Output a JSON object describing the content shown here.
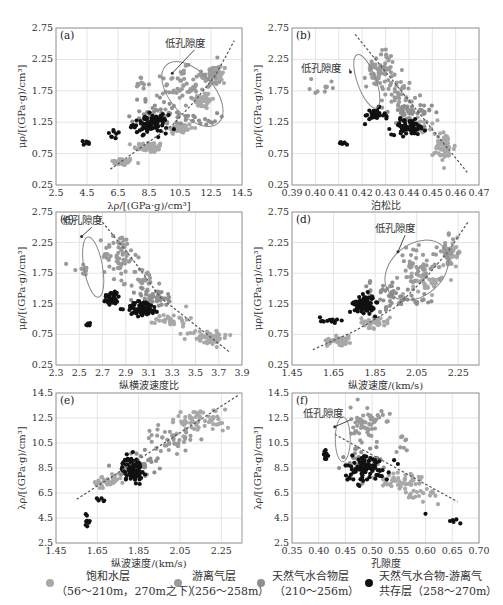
{
  "colors": {
    "saturated": "#a8a8a8",
    "free_gas": "#9a9a9a",
    "hydrate": "#8f8f8f",
    "coexist": "#111111",
    "grid": "#e4e4e4",
    "frame": "#999999",
    "trend": "#555555",
    "ellipse": "#888888"
  },
  "annotation_text": "低孔隙度",
  "chart_data": [
    {
      "id": "a",
      "type": "scatter",
      "label": "(a)",
      "box": [
        56,
        28,
        242,
        185
      ],
      "xlabel": "λρ/[(GPa·g)/cm³]",
      "ylabel": "μρ/[(GPa·g)/cm³]",
      "xlim": [
        2.5,
        14.5
      ],
      "ylim": [
        0.25,
        2.75
      ],
      "xticks": [
        "2.5",
        "4.5",
        "6.5",
        "8.5",
        "10.5",
        "12.5",
        "14.5"
      ],
      "yticks": [
        "0.25",
        "0.75",
        "1.25",
        "1.75",
        "2.25",
        "2.75"
      ],
      "grid": true,
      "trend": [
        [
          6.0,
          0.5
        ],
        [
          8.0,
          0.85
        ],
        [
          10.0,
          1.2
        ],
        [
          11.5,
          1.6
        ],
        [
          12.8,
          2.0
        ],
        [
          14.0,
          2.55
        ]
      ],
      "ellipse": {
        "cx": 11.3,
        "cy": 1.7,
        "rx": 1.4,
        "ry": 0.62,
        "rot": -42
      },
      "annotation": {
        "x": 9.5,
        "y": 2.45,
        "arrow_to": [
          10.0,
          2.03
        ]
      },
      "series": [
        {
          "name": "saturated",
          "clusters": [
            [
              6.8,
              0.62,
              0.6,
              0.05,
              40
            ],
            [
              8.5,
              0.85,
              0.8,
              0.07,
              50
            ],
            [
              10.5,
              1.15,
              0.7,
              0.08,
              45
            ],
            [
              12.0,
              1.6,
              0.5,
              0.12,
              40
            ],
            [
              13.0,
              2.0,
              0.4,
              0.15,
              30
            ]
          ]
        },
        {
          "name": "free_gas",
          "clusters": [
            [
              10.5,
              1.8,
              1.0,
              0.25,
              50
            ],
            [
              12.5,
              2.0,
              0.5,
              0.2,
              35
            ],
            [
              8.0,
              1.85,
              0.4,
              0.1,
              10
            ]
          ]
        },
        {
          "name": "hydrate",
          "clusters": [
            [
              9.0,
              1.4,
              1.4,
              0.2,
              40
            ],
            [
              11.5,
              1.3,
              1.2,
              0.08,
              20
            ]
          ]
        },
        {
          "name": "coexist",
          "clusters": [
            [
              8.6,
              1.22,
              0.9,
              0.12,
              90
            ],
            [
              4.6,
              0.92,
              0.5,
              0.03,
              6
            ],
            [
              6.3,
              1.05,
              0.4,
              0.06,
              8
            ]
          ]
        }
      ]
    },
    {
      "id": "b",
      "type": "scatter",
      "label": "(b)",
      "box": [
        292,
        28,
        479,
        185
      ],
      "xlabel": "泊松比",
      "ylabel": "μρ/[(GPa·g)/cm³]",
      "xlim": [
        0.39,
        0.47
      ],
      "ylim": [
        0.25,
        2.75
      ],
      "xticks": [
        "0.39",
        "0.40",
        "0.41",
        "0.42",
        "0.43",
        "0.44",
        "0.45",
        "0.46",
        "0.47"
      ],
      "yticks": [
        "0.25",
        "0.75",
        "1.25",
        "1.75",
        "2.25",
        "2.75"
      ],
      "grid": true,
      "trend": [
        [
          0.417,
          2.65
        ],
        [
          0.465,
          0.45
        ]
      ],
      "ellipse": {
        "cx": 0.422,
        "cy": 1.9,
        "rx": 0.004,
        "ry": 0.45,
        "rot": -20
      },
      "annotation": {
        "x": 0.394,
        "y": 2.05,
        "arrow_to": [
          0.415,
          2.05
        ]
      },
      "series": [
        {
          "name": "saturated",
          "clusters": [
            [
              0.455,
              0.85,
              0.004,
              0.2,
              60
            ],
            [
              0.445,
              1.2,
              0.004,
              0.1,
              30
            ]
          ]
        },
        {
          "name": "free_gas",
          "clusters": [
            [
              0.428,
              2.1,
              0.005,
              0.25,
              60
            ],
            [
              0.436,
              1.7,
              0.005,
              0.2,
              40
            ],
            [
              0.405,
              1.8,
              0.006,
              0.15,
              10
            ]
          ]
        },
        {
          "name": "hydrate",
          "clusters": [
            [
              0.44,
              1.4,
              0.008,
              0.12,
              40
            ]
          ]
        },
        {
          "name": "coexist",
          "clusters": [
            [
              0.44,
              1.17,
              0.006,
              0.1,
              70
            ],
            [
              0.425,
              1.35,
              0.004,
              0.1,
              30
            ],
            [
              0.412,
              0.92,
              0.002,
              0.03,
              6
            ]
          ]
        }
      ]
    },
    {
      "id": "c",
      "type": "scatter",
      "label": "(c)",
      "box": [
        56,
        212,
        242,
        365
      ],
      "xlabel": "纵横波速度比",
      "ylabel": "μρ/[(GPa·g)/cm³]",
      "xlim": [
        2.3,
        3.9
      ],
      "ylim": [
        0.25,
        2.75
      ],
      "xticks": [
        "2.3",
        "2.5",
        "2.7",
        "2.9",
        "3.1",
        "3.3",
        "3.5",
        "3.7",
        "3.9"
      ],
      "yticks": [
        "0.25",
        "0.75",
        "1.25",
        "1.75",
        "2.25",
        "2.75"
      ],
      "grid": true,
      "trend": [
        [
          2.65,
          2.7
        ],
        [
          2.95,
          2.0
        ],
        [
          3.2,
          1.35
        ],
        [
          3.5,
          0.9
        ],
        [
          3.8,
          0.45
        ]
      ],
      "ellipse": {
        "cx": 2.62,
        "cy": 1.85,
        "rx": 0.08,
        "ry": 0.5,
        "rot": -10
      },
      "annotation": {
        "x": 2.35,
        "y": 2.55,
        "arrow_to": [
          2.52,
          2.35
        ]
      },
      "series": [
        {
          "name": "saturated",
          "clusters": [
            [
              3.6,
              0.7,
              0.15,
              0.1,
              60
            ],
            [
              3.3,
              1.0,
              0.12,
              0.1,
              30
            ]
          ]
        },
        {
          "name": "free_gas",
          "clusters": [
            [
              2.85,
              2.05,
              0.12,
              0.3,
              60
            ],
            [
              3.05,
              1.6,
              0.1,
              0.2,
              30
            ],
            [
              2.5,
              1.8,
              0.08,
              0.15,
              10
            ]
          ]
        },
        {
          "name": "hydrate",
          "clusters": [
            [
              3.15,
              1.35,
              0.15,
              0.12,
              40
            ]
          ]
        },
        {
          "name": "coexist",
          "clusters": [
            [
              3.05,
              1.17,
              0.12,
              0.1,
              70
            ],
            [
              2.78,
              1.35,
              0.06,
              0.1,
              35
            ],
            [
              2.58,
              0.92,
              0.03,
              0.04,
              6
            ]
          ]
        }
      ]
    },
    {
      "id": "d",
      "type": "scatter",
      "label": "(d)",
      "box": [
        292,
        212,
        479,
        365
      ],
      "xlabel": "纵波速度/(km/s)",
      "ylabel": "μρ/[(GPa·g)/cm³]",
      "xlim": [
        1.45,
        2.35
      ],
      "ylim": [
        0.25,
        2.75
      ],
      "xticks": [
        "1.45",
        "1.65",
        "1.85",
        "2.05",
        "2.25"
      ],
      "yticks": [
        "0.25",
        "0.75",
        "1.25",
        "1.75",
        "2.25",
        "2.75"
      ],
      "grid": true,
      "trend": [
        [
          1.55,
          0.5
        ],
        [
          1.75,
          0.8
        ],
        [
          1.95,
          1.2
        ],
        [
          2.1,
          1.7
        ],
        [
          2.2,
          2.1
        ],
        [
          2.3,
          2.6
        ]
      ],
      "ellipse": {
        "cx": 2.05,
        "cy": 1.8,
        "rx": 0.17,
        "ry": 0.42,
        "rot": -40
      },
      "annotation": {
        "x": 1.85,
        "y": 2.42,
        "arrow_to": [
          1.96,
          2.1
        ]
      },
      "series": [
        {
          "name": "saturated",
          "clusters": [
            [
              1.68,
              0.65,
              0.05,
              0.06,
              50
            ],
            [
              1.85,
              0.95,
              0.06,
              0.08,
              40
            ],
            [
              2.1,
              1.6,
              0.06,
              0.15,
              40
            ],
            [
              2.22,
              2.1,
              0.04,
              0.15,
              30
            ]
          ]
        },
        {
          "name": "free_gas",
          "clusters": [
            [
              2.05,
              1.85,
              0.08,
              0.25,
              50
            ],
            [
              2.2,
              2.1,
              0.04,
              0.2,
              20
            ]
          ]
        },
        {
          "name": "hydrate",
          "clusters": [
            [
              1.9,
              1.4,
              0.1,
              0.2,
              40
            ],
            [
              2.05,
              1.3,
              0.08,
              0.1,
              15
            ]
          ]
        },
        {
          "name": "coexist",
          "clusters": [
            [
              1.8,
              1.25,
              0.04,
              0.12,
              90
            ],
            [
              1.62,
              0.98,
              0.04,
              0.06,
              12
            ]
          ]
        }
      ]
    },
    {
      "id": "e",
      "type": "scatter",
      "label": "(e)",
      "box": [
        56,
        393,
        242,
        543
      ],
      "xlabel": "纵波速度/(km/s)",
      "ylabel": "λρ/[(GPa·g)/cm³]",
      "xlim": [
        1.45,
        2.35
      ],
      "ylim": [
        2.5,
        14.5
      ],
      "xticks": [
        "1.45",
        "1.65",
        "1.85",
        "2.05",
        "2.25"
      ],
      "yticks": [
        "2.5",
        "4.5",
        "6.5",
        "8.5",
        "10.5",
        "12.5",
        "14.5"
      ],
      "grid": true,
      "trend": [
        [
          1.55,
          6.0
        ],
        [
          2.33,
          14.3
        ]
      ],
      "ellipse": null,
      "annotation": null,
      "series": [
        {
          "name": "saturated",
          "clusters": [
            [
              1.7,
              7.3,
              0.06,
              0.5,
              40
            ],
            [
              2.15,
              12.3,
              0.12,
              0.8,
              60
            ]
          ]
        },
        {
          "name": "free_gas",
          "clusters": [
            [
              2.0,
              10.8,
              0.1,
              0.8,
              40
            ]
          ]
        },
        {
          "name": "hydrate",
          "clusters": [
            [
              1.85,
              8.8,
              0.08,
              0.8,
              40
            ]
          ]
        },
        {
          "name": "coexist",
          "clusters": [
            [
              1.82,
              8.4,
              0.04,
              0.8,
              90
            ],
            [
              1.6,
              4.4,
              0.01,
              0.4,
              8
            ],
            [
              1.67,
              6.0,
              0.02,
              0.3,
              5
            ]
          ]
        }
      ]
    },
    {
      "id": "f",
      "type": "scatter",
      "label": "(f)",
      "box": [
        292,
        393,
        479,
        543
      ],
      "xlabel": "孔隙度",
      "ylabel": "λρ/[(GPa·g)/cm³]",
      "xlim": [
        0.35,
        0.7
      ],
      "ylim": [
        2.5,
        14.5
      ],
      "xticks": [
        "0.35",
        "0.40",
        "0.45",
        "0.50",
        "0.55",
        "0.60",
        "0.65",
        "0.70"
      ],
      "yticks": [
        "2.5",
        "4.5",
        "6.5",
        "8.5",
        "10.5",
        "12.5",
        "14.5"
      ],
      "grid": true,
      "trend": [
        [
          0.43,
          11.2
        ],
        [
          0.66,
          5.8
        ]
      ],
      "ellipse": {
        "cx": 0.445,
        "cy": 10.8,
        "rx": 0.014,
        "ry": 1.8,
        "rot": 0
      },
      "annotation": {
        "x": 0.37,
        "y": 12.6,
        "arrow_to": [
          0.43,
          11.8
        ]
      },
      "series": [
        {
          "name": "saturated",
          "clusters": [
            [
              0.55,
              7.4,
              0.04,
              0.8,
              50
            ],
            [
              0.6,
              6.4,
              0.03,
              0.5,
              20
            ]
          ]
        },
        {
          "name": "free_gas",
          "clusters": [
            [
              0.49,
              12.0,
              0.025,
              1.2,
              60
            ],
            [
              0.555,
              10.5,
              0.01,
              0.8,
              8
            ]
          ]
        },
        {
          "name": "hydrate",
          "clusters": [
            [
              0.48,
              9.0,
              0.03,
              1.0,
              40
            ]
          ]
        },
        {
          "name": "coexist",
          "clusters": [
            [
              0.49,
              8.5,
              0.035,
              0.9,
              90
            ],
            [
              0.41,
              9.6,
              0.01,
              0.5,
              8
            ],
            [
              0.65,
              4.2,
              0.02,
              0.2,
              5
            ],
            [
              0.6,
              4.8,
              0.005,
              0.1,
              1
            ]
          ]
        }
      ]
    }
  ],
  "legend": [
    {
      "name": "saturated",
      "line1": "饱和水层",
      "line2": "（56～210m，270m之下）"
    },
    {
      "name": "free_gas",
      "line1": "游离气层",
      "line2": "（256～258m）"
    },
    {
      "name": "hydrate",
      "line1": "天然气水合物层",
      "line2": "（210～256m）"
    },
    {
      "name": "coexist",
      "line1": "天然气水合物-游离气",
      "line2": "共存层（258～270m）"
    }
  ]
}
